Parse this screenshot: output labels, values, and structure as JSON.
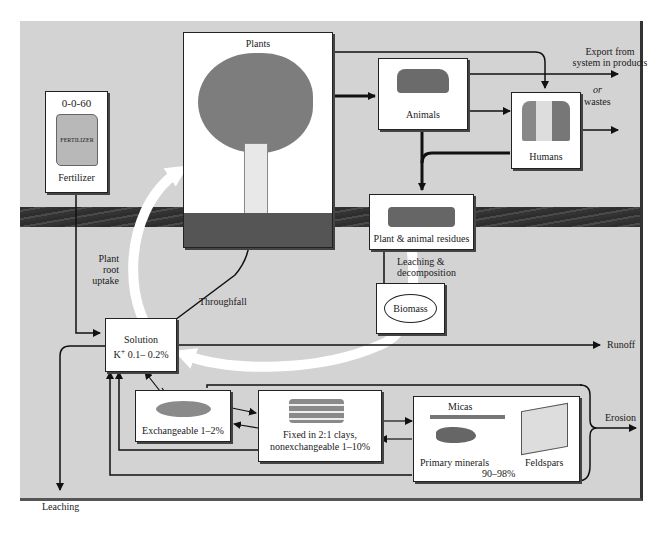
{
  "diagram": {
    "type": "potassium-cycle",
    "nodes": {
      "fertilizer": {
        "grade": "0-0-60",
        "bag_text": "FERTILIZER",
        "label": "Fertilizer"
      },
      "plants": {
        "label": "Plants"
      },
      "animals": {
        "label": "Animals"
      },
      "humans": {
        "label": "Humans"
      },
      "residues": {
        "label": "Plant & animal residues"
      },
      "biomass": {
        "label": "Biomass"
      },
      "solution": {
        "line1": "Solution",
        "line2_prefix": "K",
        "line2_sup": "+",
        "line2_value": " 0.1– 0.2%"
      },
      "exchangeable": {
        "label": "Exchangeable 1–2%"
      },
      "fixed": {
        "line1": "Fixed in 2:1 clays,",
        "line2": "nonexchangeable 1–10%"
      },
      "primary": {
        "micas": "Micas",
        "label": "Primary minerals",
        "feldspars": "Feldspars",
        "percent": "90–98%"
      }
    },
    "flow_labels": {
      "export": "Export from",
      "export2": "system in products",
      "or": "or",
      "wastes": "wastes",
      "plant_root_uptake_1": "Plant",
      "plant_root_uptake_2": "root",
      "plant_root_uptake_3": "uptake",
      "throughfall": "Throughfall",
      "leaching_decomp_1": "Leaching &",
      "leaching_decomp_2": "decomposition",
      "runoff": "Runoff",
      "erosion": "Erosion",
      "leaching": "Leaching"
    },
    "colors": {
      "panel_bg": "#d3d3d3",
      "soil_band": "#3a3a3a",
      "box_bg": "#ffffff",
      "line": "#111111",
      "cycle_arrow": "#ffffff"
    }
  }
}
